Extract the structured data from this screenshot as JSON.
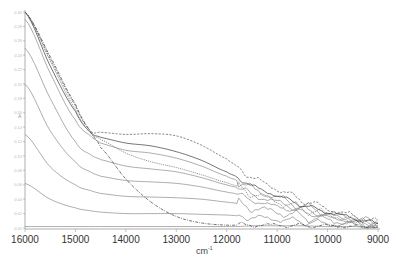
{
  "chart_data": {
    "type": "line",
    "title": "",
    "xlabel": "cm-1",
    "ylabel": "A",
    "xlim": [
      16000,
      9000
    ],
    "ylim": [
      0.0,
      0.3
    ],
    "x_reversed": true,
    "grid": false,
    "legend": null,
    "x_ticks": [
      16000,
      15000,
      14000,
      13000,
      12000,
      11000,
      10000,
      9000
    ],
    "x_tick_labels": [
      "16000",
      "15000",
      "14000",
      "13000",
      "12000",
      "11000",
      "10000",
      "9000"
    ],
    "y_ticks": [
      0.0,
      0.02,
      0.04,
      0.06,
      0.08,
      0.1,
      0.12,
      0.14,
      0.16,
      0.18,
      0.2,
      0.22,
      0.24,
      0.26,
      0.28,
      0.3
    ],
    "y_tick_labels": [
      "0.00",
      "0.02",
      "0.04",
      "0.06",
      "0.08",
      "0.10",
      "0.12",
      "0.14",
      "0.16",
      "0.18",
      "0.20",
      "0.22",
      "0.24",
      "0.26",
      "0.28",
      "0.30"
    ],
    "annotations": [
      "isosbestic-like crossing near 14700 cm-1, A≈0.13",
      "noisy oscillations below ~11800 cm-1"
    ],
    "x": [
      16000,
      15500,
      15000,
      14700,
      14500,
      14000,
      13500,
      13000,
      12500,
      12000,
      11800,
      11500,
      11000,
      10500,
      10000,
      9500,
      9000
    ],
    "series": [
      {
        "name": "s1",
        "style": "solid",
        "values": [
          0.002,
          0.002,
          0.002,
          0.002,
          0.002,
          0.002,
          0.002,
          0.002,
          0.002,
          0.002,
          0.002,
          0.003,
          0.003,
          0.003,
          0.002,
          0.002,
          0.001
        ]
      },
      {
        "name": "s2",
        "style": "solid",
        "values": [
          0.062,
          0.04,
          0.028,
          0.024,
          0.022,
          0.02,
          0.02,
          0.02,
          0.019,
          0.018,
          0.017,
          0.015,
          0.012,
          0.009,
          0.006,
          0.004,
          0.002
        ]
      },
      {
        "name": "s3",
        "style": "solid",
        "values": [
          0.13,
          0.085,
          0.06,
          0.052,
          0.048,
          0.044,
          0.043,
          0.042,
          0.04,
          0.036,
          0.034,
          0.028,
          0.022,
          0.016,
          0.011,
          0.007,
          0.003
        ]
      },
      {
        "name": "s4",
        "style": "solid",
        "values": [
          0.2,
          0.135,
          0.092,
          0.078,
          0.072,
          0.066,
          0.064,
          0.062,
          0.057,
          0.05,
          0.047,
          0.038,
          0.03,
          0.022,
          0.015,
          0.009,
          0.004
        ]
      },
      {
        "name": "s5",
        "style": "solid",
        "values": [
          0.25,
          0.18,
          0.12,
          0.102,
          0.095,
          0.086,
          0.082,
          0.078,
          0.07,
          0.06,
          0.056,
          0.046,
          0.036,
          0.026,
          0.018,
          0.011,
          0.005
        ]
      },
      {
        "name": "s6",
        "style": "solid",
        "values": [
          0.29,
          0.215,
          0.15,
          0.128,
          0.118,
          0.108,
          0.104,
          0.097,
          0.086,
          0.072,
          0.066,
          0.054,
          0.042,
          0.03,
          0.021,
          0.013,
          0.006
        ]
      },
      {
        "name": "s7",
        "style": "solid-dark",
        "values": [
          0.3,
          0.225,
          0.162,
          0.133,
          0.126,
          0.118,
          0.114,
          0.106,
          0.094,
          0.078,
          0.071,
          0.058,
          0.045,
          0.032,
          0.022,
          0.014,
          0.006
        ]
      },
      {
        "name": "s8",
        "style": "dashed",
        "values": [
          0.3,
          0.235,
          0.17,
          0.135,
          0.133,
          0.13,
          0.131,
          0.128,
          0.115,
          0.096,
          0.086,
          0.07,
          0.054,
          0.039,
          0.027,
          0.017,
          0.008
        ]
      },
      {
        "name": "s9",
        "style": "dashed-fine",
        "values": [
          0.3,
          0.232,
          0.165,
          0.132,
          0.123,
          0.104,
          0.092,
          0.084,
          0.074,
          0.063,
          0.058,
          0.048,
          0.037,
          0.027,
          0.019,
          0.012,
          0.005
        ]
      },
      {
        "name": "s10",
        "style": "dash-dot",
        "values": [
          0.3,
          0.238,
          0.172,
          0.134,
          0.112,
          0.068,
          0.036,
          0.016,
          0.007,
          0.004,
          0.004,
          0.004,
          0.004,
          0.003,
          0.003,
          0.002,
          0.001
        ]
      }
    ]
  },
  "axes": {
    "x_title": "cm",
    "x_title_sup": "-1",
    "y_title": "A"
  }
}
